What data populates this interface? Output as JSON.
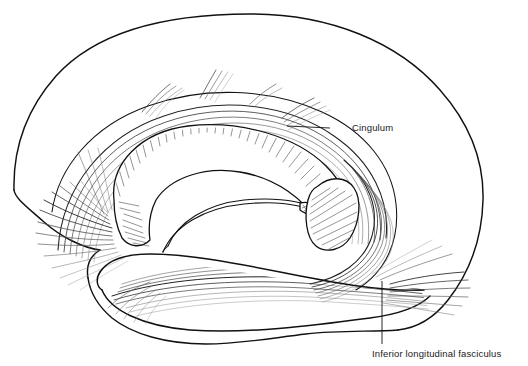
{
  "figure": {
    "title_fragment": "",
    "background_color": "#ffffff",
    "ink_color": "#111111"
  },
  "labels": [
    {
      "id": "cingulum",
      "text": "Cingulum",
      "text_x": 352,
      "text_y": 131,
      "leader": {
        "x1": 330,
        "y1": 128,
        "x2": 287,
        "y2": 126
      },
      "anchor": "start"
    },
    {
      "id": "inferior-longitudinal-fasciculus",
      "text": "Inferior longitudinal fasciculus",
      "text_x": 372,
      "text_y": 357,
      "leader": {
        "x1": 382,
        "y1": 281,
        "x2": 382,
        "y2": 344
      },
      "anchor": "start"
    }
  ],
  "structures": [
    {
      "id": "cerebral-outline",
      "name": "cerebral hemisphere outline"
    },
    {
      "id": "corpus-callosum",
      "name": "corpus callosum"
    },
    {
      "id": "fornix",
      "name": "fornix"
    },
    {
      "id": "temporal-lobe",
      "name": "temporal lobe"
    },
    {
      "id": "splenium-pulvinar",
      "name": "splenium / pulvinar region"
    },
    {
      "id": "cingulum-bundle",
      "name": "cingulum fiber bundle"
    },
    {
      "id": "ilf-bundle",
      "name": "inferior longitudinal fasciculus bundle"
    },
    {
      "id": "frontal-radiation",
      "name": "frontal fiber radiation"
    },
    {
      "id": "occipital-radiation",
      "name": "occipital fiber radiation"
    },
    {
      "id": "temporal-radiation",
      "name": "temporal fiber radiation"
    }
  ]
}
